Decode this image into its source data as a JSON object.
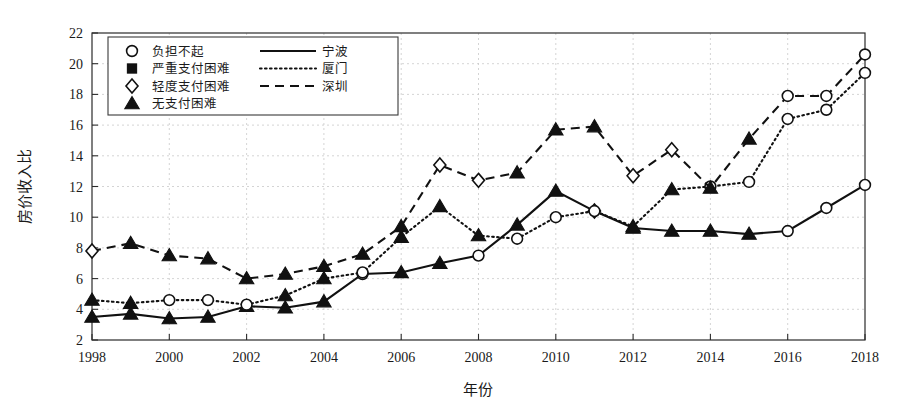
{
  "chart_data": {
    "type": "line",
    "title": "",
    "xlabel": "年份",
    "ylabel": "房价收入比",
    "xlim": [
      1998,
      2018
    ],
    "ylim": [
      2,
      22
    ],
    "ytick_step": 2,
    "xtick_step": 2,
    "grid": true,
    "legend_position": "top-left",
    "x": [
      1998,
      1999,
      2000,
      2001,
      2002,
      2003,
      2004,
      2005,
      2006,
      2007,
      2008,
      2009,
      2010,
      2011,
      2012,
      2013,
      2014,
      2015,
      2016,
      2017,
      2018
    ],
    "xtick_labels": [
      "1998",
      "2000",
      "2002",
      "2004",
      "2006",
      "2008",
      "2010",
      "2012",
      "2014",
      "2016",
      "2018"
    ],
    "ytick_labels": [
      "2",
      "4",
      "6",
      "8",
      "10",
      "12",
      "14",
      "16",
      "18",
      "20",
      "22"
    ],
    "series": [
      {
        "name": "宁波",
        "line_style": "solid",
        "values": [
          3.5,
          3.7,
          3.4,
          3.5,
          4.2,
          4.1,
          4.5,
          6.3,
          6.4,
          7.0,
          7.5,
          9.5,
          11.7,
          10.4,
          9.3,
          9.1,
          9.1,
          8.9,
          9.1,
          10.6,
          12.1
        ],
        "markers": [
          "triangle-filled",
          "triangle-filled",
          "triangle-filled",
          "triangle-filled",
          "triangle-filled",
          "triangle-filled",
          "triangle-filled",
          "circle-open",
          "triangle-filled",
          "triangle-filled",
          "circle-open",
          "triangle-filled",
          "triangle-filled",
          "diamond-open",
          "triangle-filled",
          "triangle-filled",
          "triangle-filled",
          "triangle-filled",
          "circle-open",
          "circle-open",
          "circle-open"
        ]
      },
      {
        "name": "厦门",
        "line_style": "dotted",
        "values": [
          4.6,
          4.4,
          4.6,
          4.6,
          4.3,
          4.9,
          6.0,
          6.4,
          8.7,
          10.7,
          8.8,
          8.6,
          10.0,
          10.4,
          9.4,
          11.8,
          12.0,
          12.3,
          16.4,
          17.0,
          19.4
        ],
        "markers": [
          "triangle-filled",
          "triangle-filled",
          "circle-open",
          "circle-open",
          "circle-open",
          "triangle-filled",
          "triangle-filled",
          "circle-open",
          "triangle-filled",
          "triangle-filled",
          "triangle-filled",
          "circle-open",
          "circle-open",
          "circle-open",
          "triangle-filled",
          "triangle-filled",
          "circle-open",
          "circle-open",
          "circle-open",
          "circle-open",
          "circle-open"
        ]
      },
      {
        "name": "深圳",
        "line_style": "dashed",
        "values": [
          7.8,
          8.3,
          7.5,
          7.3,
          6.0,
          6.3,
          6.8,
          7.6,
          9.4,
          13.4,
          12.4,
          12.9,
          15.7,
          15.9,
          12.7,
          14.4,
          11.9,
          15.1,
          17.9,
          17.9,
          20.6
        ],
        "markers": [
          "diamond-open",
          "triangle-filled",
          "triangle-filled",
          "triangle-filled",
          "triangle-filled",
          "triangle-filled",
          "triangle-filled",
          "triangle-filled",
          "triangle-filled",
          "diamond-open",
          "diamond-open",
          "triangle-filled",
          "triangle-filled",
          "triangle-filled",
          "diamond-open",
          "diamond-open",
          "triangle-filled",
          "triangle-filled",
          "circle-open",
          "circle-open",
          "circle-open"
        ]
      }
    ],
    "marker_legend": [
      {
        "marker": "circle-open",
        "label": "负担不起"
      },
      {
        "marker": "square-filled",
        "label": "严重支付困难"
      },
      {
        "marker": "diamond-open",
        "label": "轻度支付困难"
      },
      {
        "marker": "triangle-filled",
        "label": "无支付困难"
      }
    ],
    "line_legend": [
      {
        "line_style": "solid",
        "label": "宁波"
      },
      {
        "line_style": "dotted",
        "label": "厦门"
      },
      {
        "line_style": "dashed",
        "label": "深圳"
      }
    ],
    "colors": {
      "line": "#111111",
      "grid": "#c9c9c9",
      "frame": "#2b2b2b",
      "marker_fill": "#ffffff"
    }
  }
}
